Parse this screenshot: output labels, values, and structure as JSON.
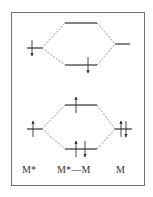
{
  "diagram": {
    "type": "molecular-orbital-energy-level-diagram",
    "labels": {
      "left": "M*",
      "middle": "M*—M",
      "right": "M"
    },
    "colors": {
      "line": "#333333",
      "dashed_connector": "#777777",
      "frame": "#6f6f6f",
      "background": "#ffffff"
    },
    "panels": [
      {
        "name": "top-panel",
        "levels": [
          {
            "name": "left-atomic-level",
            "x1": 27,
            "x2": 42,
            "y": 48,
            "electrons": [
              {
                "x": 32,
                "dir": "down"
              }
            ]
          },
          {
            "name": "upper-mo-level",
            "x1": 65,
            "x2": 97,
            "y": 23,
            "electrons": []
          },
          {
            "name": "lower-mo-level",
            "x1": 65,
            "x2": 97,
            "y": 65,
            "electrons": [
              {
                "x": 88,
                "dir": "down"
              }
            ]
          },
          {
            "name": "right-atomic-level",
            "x1": 115,
            "x2": 130,
            "y": 44,
            "electrons": []
          }
        ]
      },
      {
        "name": "bottom-panel",
        "levels": [
          {
            "name": "left-atomic-level",
            "x1": 27,
            "x2": 42,
            "y": 129,
            "electrons": [
              {
                "x": 33,
                "dir": "up"
              }
            ]
          },
          {
            "name": "upper-mo-level",
            "x1": 65,
            "x2": 97,
            "y": 105,
            "electrons": [
              {
                "x": 76,
                "dir": "up"
              }
            ]
          },
          {
            "name": "lower-mo-level",
            "x1": 65,
            "x2": 97,
            "y": 149,
            "electrons": [
              {
                "x": 76,
                "dir": "up"
              },
              {
                "x": 85,
                "dir": "down"
              }
            ]
          },
          {
            "name": "right-atomic-level",
            "x1": 115,
            "x2": 132,
            "y": 129,
            "electrons": [
              {
                "x": 121,
                "dir": "up"
              },
              {
                "x": 126,
                "dir": "down"
              }
            ]
          }
        ]
      }
    ]
  }
}
